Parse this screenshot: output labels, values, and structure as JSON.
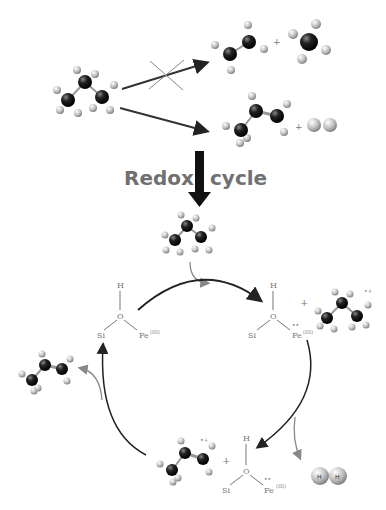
{
  "title": {
    "left": "Redox",
    "right": "cycle"
  },
  "labels": {
    "H": "H",
    "O": "O",
    "Si": "Si",
    "Fe_III": "Fe(III)",
    "Fe_III_text": "Fe",
    "Fe_sup": "(III)",
    "radical_dots": "••",
    "radical_plus": "•+",
    "plus": "+",
    "H_atom": "H"
  },
  "species": {
    "reactant": "propane",
    "disfavored_products": [
      "ethylene",
      "methane"
    ],
    "favored_products": [
      "propylene",
      "H2"
    ],
    "cycle": [
      "Si-OH-Fe(III)",
      "propane radical cation + reduced site",
      "propylene radical cation + site",
      "H2",
      "propylene"
    ]
  }
}
